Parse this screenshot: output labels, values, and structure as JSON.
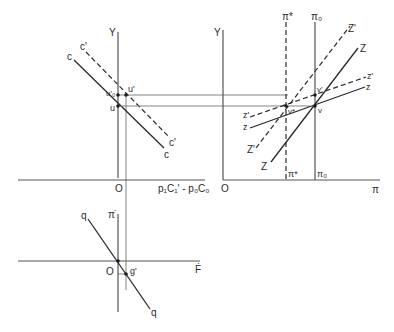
{
  "diagram": {
    "top_left_panel": {
      "y_axis_label": "Y",
      "x_axis_label_origin": "O",
      "x_axis_label": "p₁C₁' - p₀C₀",
      "line_c_label_top": "c",
      "line_c_label_bottom": "c",
      "line_c_prime_label_top": "c'",
      "line_c_prime_label_bottom": "c'",
      "point_u_label": "u",
      "point_u_prime_label": "u'",
      "point_u0_prime_label": "u'₀"
    },
    "top_right_panel": {
      "y_axis_label": "Y",
      "origin_label": "O",
      "x_axis_label": "π",
      "pi_star_top_label": "π*",
      "pi_star_bottom_label": "π*",
      "pi0_top_label": "π₀",
      "pi0_bottom_label": "π₀",
      "Z_prime_upper_label": "Z'",
      "Z_upper_label": "Z",
      "z_prime_upper_label": "z'",
      "z_upper_label": "z",
      "z_prime_lower_label": "z'",
      "z_lower_label": "z",
      "Z_prime_lower_label": "Z'",
      "Z_lower_label": "Z",
      "point_v_label": "v",
      "point_v_prime_label": "v'",
      "point_v_star_label": "v*"
    },
    "bottom_panel": {
      "y_axis_label": "π̇",
      "x_axis_label": "Ḟ",
      "origin_label": "O",
      "line_q_label_top": "q",
      "line_q_label_bottom": "q",
      "point_g_prime_label": "g'"
    }
  }
}
